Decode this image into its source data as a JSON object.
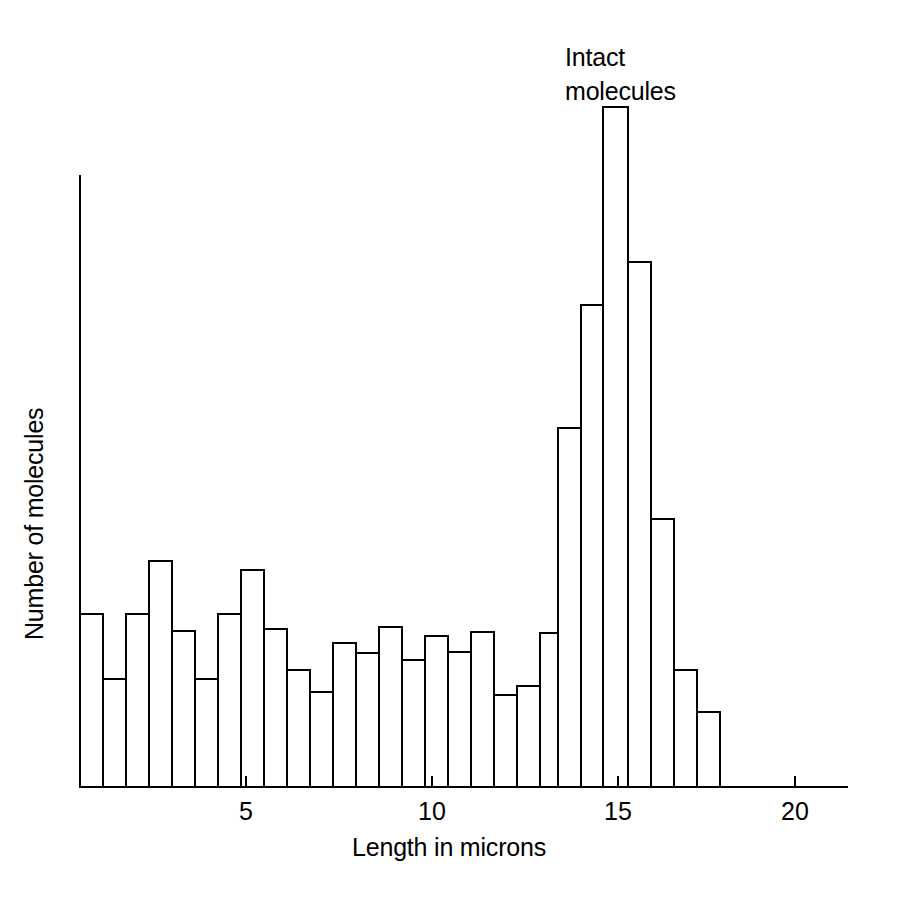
{
  "figure": {
    "background_color": "#ffffff",
    "line_color": "#000000"
  },
  "annotation": {
    "intact_molecules": "Intact\nmolecules"
  },
  "axes": {
    "x_title": "Length in microns",
    "y_title": "Number of molecules",
    "x_tick_labels": [
      "5",
      "10",
      "15",
      "20"
    ],
    "x_tick_values": [
      5,
      10,
      15,
      20
    ]
  },
  "chart_data": {
    "type": "bar",
    "title": "",
    "subtitle": "",
    "xlabel": "Length in microns",
    "ylabel": "Number of molecules",
    "xlim": [
      0,
      20.6
    ],
    "ylim": [
      0,
      100
    ],
    "grid": false,
    "legend": "none",
    "bin_width": 0.62,
    "annotations": [
      {
        "text": "Intact molecules",
        "x": 15.0,
        "y": 95
      }
    ],
    "categories": [
      "0.0-0.6",
      "0.6-1.2",
      "1.2-1.9",
      "1.9-2.5",
      "2.5-3.1",
      "3.1-3.7",
      "3.7-4.3",
      "4.3-5.0",
      "5.0-5.6",
      "5.6-6.2",
      "6.2-6.8",
      "6.8-7.4",
      "7.4-8.1",
      "8.1-8.7",
      "8.7-9.3",
      "9.3-9.9",
      "9.9-10.5",
      "10.5-11.2",
      "11.2-11.8",
      "11.8-12.4",
      "12.4-13.0",
      "13.0-13.6",
      "13.6-14.3",
      "14.3-14.9",
      "14.9-15.5",
      "15.5-16.1",
      "16.1-16.7",
      "16.7-17.4",
      "17.4-18.0"
    ],
    "x": [
      0.31,
      0.93,
      1.55,
      2.17,
      2.79,
      3.41,
      4.03,
      4.65,
      5.27,
      5.89,
      6.51,
      7.13,
      7.75,
      8.37,
      8.99,
      9.61,
      10.23,
      10.85,
      11.47,
      12.09,
      12.71,
      13.33,
      13.95,
      14.57,
      15.19,
      15.81,
      16.43,
      17.05,
      17.67
    ],
    "values": [
      28.6,
      18.0,
      28.6,
      36.3,
      21.9,
      18.0,
      28.6,
      35.0,
      25.0,
      19.4,
      14.8,
      22.6,
      20.9,
      26.1,
      19.4,
      23.3,
      20.9,
      23.8,
      15.3,
      16.9,
      23.8,
      58.7,
      80.2,
      111.0,
      86.6,
      43.7,
      18.3,
      11.6,
      0.0
    ],
    "values_note": "Bar heights as percent of plot height; peak at 14.3-14.9 microns"
  },
  "bars": [
    {
      "i": 0,
      "top_y": 614,
      "x0": 80,
      "x1": 103
    },
    {
      "i": 1,
      "top_y": 679,
      "x0": 103,
      "x1": 126
    },
    {
      "i": 2,
      "top_y": 614,
      "x0": 126,
      "x1": 149
    },
    {
      "i": 3,
      "top_y": 561,
      "x0": 149,
      "x1": 172
    },
    {
      "i": 4,
      "top_y": 631,
      "x0": 172,
      "x1": 195
    },
    {
      "i": 5,
      "top_y": 679,
      "x0": 195,
      "x1": 218
    },
    {
      "i": 6,
      "top_y": 614,
      "x0": 218,
      "x1": 241
    },
    {
      "i": 7,
      "top_y": 570,
      "x0": 241,
      "x1": 264
    },
    {
      "i": 8,
      "top_y": 629,
      "x0": 264,
      "x1": 287
    },
    {
      "i": 9,
      "top_y": 670,
      "x0": 287,
      "x1": 310
    },
    {
      "i": 10,
      "top_y": 692,
      "x0": 310,
      "x1": 333
    },
    {
      "i": 11,
      "top_y": 643,
      "x0": 333,
      "x1": 356
    },
    {
      "i": 12,
      "top_y": 653,
      "x0": 356,
      "x1": 379
    },
    {
      "i": 13,
      "top_y": 627,
      "x0": 379,
      "x1": 402
    },
    {
      "i": 14,
      "top_y": 660,
      "x0": 402,
      "x1": 425
    },
    {
      "i": 15,
      "top_y": 636,
      "x0": 425,
      "x1": 448
    },
    {
      "i": 16,
      "top_y": 652,
      "x0": 448,
      "x1": 471
    },
    {
      "i": 17,
      "top_y": 632,
      "x0": 471,
      "x1": 494
    },
    {
      "i": 18,
      "top_y": 695,
      "x0": 494,
      "x1": 517
    },
    {
      "i": 19,
      "top_y": 686,
      "x0": 517,
      "x1": 540
    },
    {
      "i": 20,
      "top_y": 633,
      "x0": 540,
      "x1": 558
    },
    {
      "i": 21,
      "top_y": 428,
      "x0": 558,
      "x1": 581
    },
    {
      "i": 22,
      "top_y": 305,
      "x0": 581,
      "x1": 603
    },
    {
      "i": 23,
      "top_y": 107,
      "x0": 603,
      "x1": 628
    },
    {
      "i": 24,
      "top_y": 262,
      "x0": 628,
      "x1": 651
    },
    {
      "i": 25,
      "top_y": 519,
      "x0": 651,
      "x1": 674
    },
    {
      "i": 26,
      "top_y": 670,
      "x0": 674,
      "x1": 697
    },
    {
      "i": 27,
      "top_y": 712,
      "x0": 697,
      "x1": 720
    }
  ],
  "geometry": {
    "baseline_y": 787,
    "y_axis_x": 80,
    "y_axis_top": 175,
    "x_axis_right": 848,
    "tick_positions": [
      {
        "label": "5",
        "x": 246
      },
      {
        "label": "10",
        "x": 432
      },
      {
        "label": "15",
        "x": 618
      },
      {
        "label": "20",
        "x": 795
      }
    ]
  }
}
